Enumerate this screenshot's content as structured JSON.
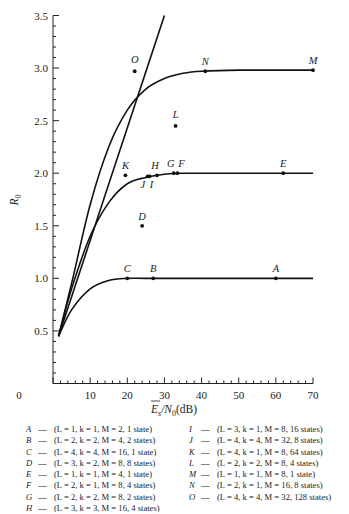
{
  "chart_data": {
    "type": "line",
    "title": "",
    "xlabel": "E_s/N_0(dB)",
    "xlabel_display": "Ē_s/N_0(dB)",
    "ylabel": "R_0",
    "xlim": [
      0,
      70
    ],
    "ylim": [
      0,
      3.5
    ],
    "x_ticks": [
      "0",
      "10",
      "20",
      "30",
      "40",
      "50",
      "60",
      "70"
    ],
    "y_ticks": [
      "0.5",
      "1.0",
      "1.5",
      "2.0",
      "2.5",
      "3.0",
      "3.5"
    ],
    "grid": false,
    "legend_position": "below",
    "series": [
      {
        "name": "Capacity bound (straight line)",
        "x": [
          1.5,
          30
        ],
        "y": [
          0.45,
          3.5
        ]
      },
      {
        "name": "R0 = 3 curve",
        "x": [
          1.5,
          5,
          10,
          15,
          20,
          25,
          30,
          35,
          40,
          50,
          70
        ],
        "y": [
          0.45,
          0.95,
          1.7,
          2.25,
          2.6,
          2.8,
          2.9,
          2.95,
          2.97,
          2.98,
          2.98
        ]
      },
      {
        "name": "R0 = 2 curve",
        "x": [
          1.5,
          5,
          10,
          15,
          20,
          25,
          30,
          35,
          50,
          70
        ],
        "y": [
          0.45,
          0.9,
          1.4,
          1.72,
          1.9,
          1.96,
          1.99,
          2.0,
          2.0,
          2.0
        ]
      },
      {
        "name": "R0 = 1 curve",
        "x": [
          1.5,
          5,
          10,
          15,
          20,
          25,
          40,
          70
        ],
        "y": [
          0.45,
          0.7,
          0.9,
          0.98,
          1.0,
          1.0,
          1.0,
          1.0
        ]
      }
    ],
    "points": [
      {
        "label": "A",
        "x": 60,
        "y": 1.0
      },
      {
        "label": "B",
        "x": 27,
        "y": 1.0
      },
      {
        "label": "C",
        "x": 20,
        "y": 1.0
      },
      {
        "label": "D",
        "x": 24,
        "y": 1.5
      },
      {
        "label": "E",
        "x": 62,
        "y": 2.0
      },
      {
        "label": "F",
        "x": 33.5,
        "y": 2.0
      },
      {
        "label": "G",
        "x": 32.5,
        "y": 2.0
      },
      {
        "label": "H",
        "x": 28,
        "y": 1.98
      },
      {
        "label": "I",
        "x": 26,
        "y": 1.97
      },
      {
        "label": "J",
        "x": 25.5,
        "y": 1.97
      },
      {
        "label": "K",
        "x": 19.5,
        "y": 1.98
      },
      {
        "label": "L",
        "x": 33,
        "y": 2.45
      },
      {
        "label": "M",
        "x": 70,
        "y": 2.98
      },
      {
        "label": "N",
        "x": 41,
        "y": 2.97
      },
      {
        "label": "O",
        "x": 22,
        "y": 2.97
      }
    ]
  },
  "axis": {
    "x_title_main": "E",
    "x_title_sub": "s",
    "x_title_rest": "/N",
    "x_title_sub2": "0",
    "x_title_unit": "(dB)",
    "y_title_main": "R",
    "y_title_sub": "0"
  },
  "legend": {
    "left": [
      {
        "key": "A",
        "dash": "—",
        "text": "(L = 1, k = 1, M = 2, 1 state)"
      },
      {
        "key": "B",
        "dash": "—",
        "text": "(L = 2, k = 2, M = 4, 2 states)"
      },
      {
        "key": "C",
        "dash": "—",
        "text": "(L = 4, k = 4, M = 16, 1 state)"
      },
      {
        "key": "D",
        "dash": "—",
        "text": "(L = 3, k = 2, M = 8, 8 states)"
      },
      {
        "key": "E",
        "dash": "—",
        "text": "(L = 1, k = 1, M = 4, 1 state)"
      },
      {
        "key": "F",
        "dash": "—",
        "text": "(L = 2, k = 1, M = 8, 4 states)"
      },
      {
        "key": "G",
        "dash": "—",
        "text": "(L = 2, k = 2, M = 8, 2 states)"
      },
      {
        "key": "H",
        "dash": "—",
        "text": "(L = 3, k = 3, M = 16, 4 states)"
      }
    ],
    "right": [
      {
        "key": "I",
        "dash": "—",
        "text": "(L = 3, k = 1, M = 8, 16 states)"
      },
      {
        "key": "J",
        "dash": "—",
        "text": "(L = 4, k = 4, M = 32, 8 states)"
      },
      {
        "key": "K",
        "dash": "—",
        "text": "(L = 4, k = 1, M = 8, 64 states)"
      },
      {
        "key": "L",
        "dash": "—",
        "text": "(L = 2, k = 2, M = 8, 4 states)"
      },
      {
        "key": "M",
        "dash": "—",
        "text": "(L = 1, k = 1, M = 8, 1 state)"
      },
      {
        "key": "N",
        "dash": "—",
        "text": "(L = 2, k = 1, M = 16, 8 states)"
      },
      {
        "key": "O",
        "dash": "—",
        "text": "(L = 4, k = 4, M = 32, 128 states)"
      }
    ]
  }
}
